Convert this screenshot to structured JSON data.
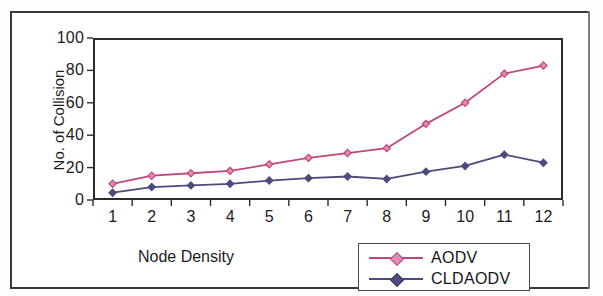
{
  "chart_data": {
    "type": "line",
    "title": "",
    "xlabel": "Node Density",
    "ylabel": "No. of Collision",
    "categories": [
      "1",
      "2",
      "3",
      "4",
      "5",
      "6",
      "7",
      "8",
      "9",
      "10",
      "11",
      "12"
    ],
    "ytick_labels": [
      "100",
      "80",
      "60",
      "40",
      "20",
      "0"
    ],
    "ylim": [
      0,
      100
    ],
    "ytick_step": 20,
    "grid": false,
    "legend_position": "bottom-right",
    "marker": "diamond",
    "series": [
      {
        "name": "AODV",
        "color": "#c2457e",
        "values": [
          10,
          15,
          16.5,
          18,
          22,
          26,
          29,
          32,
          47,
          60,
          78,
          83
        ]
      },
      {
        "name": "CLDAODV",
        "color": "#4b4b7d",
        "values": [
          4.5,
          8,
          9,
          10,
          12,
          13.5,
          14.5,
          13,
          17.5,
          21,
          28,
          23
        ]
      }
    ]
  },
  "legend": {
    "entries": [
      {
        "label": "AODV"
      },
      {
        "label": "CLDAODV"
      }
    ]
  },
  "colors": {
    "series_aodv": "#c2457e",
    "series_cldaodv": "#4b4b7d",
    "axis": "#2c2c2c",
    "frame": "#3a3a3a",
    "text": "#1c1c1c"
  }
}
